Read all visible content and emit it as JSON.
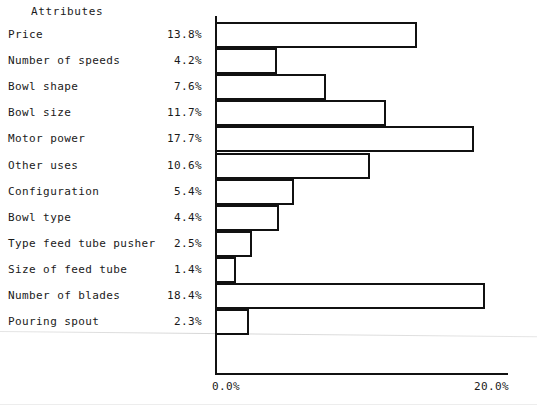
{
  "header": {
    "attributes_label": "Attributes"
  },
  "axis": {
    "tick_min_label": "0.0%",
    "tick_max_label": "20.0%"
  },
  "chart_data": {
    "type": "bar",
    "orientation": "horizontal",
    "title": "",
    "xlabel": "",
    "ylabel": "Attributes",
    "xlim": [
      0.0,
      20.0
    ],
    "grid": false,
    "legend": "none",
    "bar_style": "outlined",
    "categories": [
      "Price",
      "Number of speeds",
      "Bowl shape",
      "Bowl size",
      "Motor power",
      "Other uses",
      "Configuration",
      "Bowl type",
      "Type feed tube pusher",
      "Size of feed tube",
      "Number of blades",
      "Pouring spout"
    ],
    "values": [
      13.8,
      4.2,
      7.6,
      11.7,
      17.7,
      10.6,
      5.4,
      4.4,
      2.5,
      1.4,
      18.4,
      2.3
    ],
    "value_labels": [
      "13.8%",
      "4.2%",
      "7.6%",
      "11.7%",
      "17.7%",
      "10.6%",
      "5.4%",
      "4.4%",
      "2.5%",
      "1.4%",
      "18.4%",
      "2.3%"
    ],
    "tick_labels": [
      "0.0%",
      "20.0%"
    ],
    "tick_values": [
      0.0,
      20.0
    ]
  },
  "colors": {
    "ink": "#111111",
    "page": "#ffffff"
  }
}
